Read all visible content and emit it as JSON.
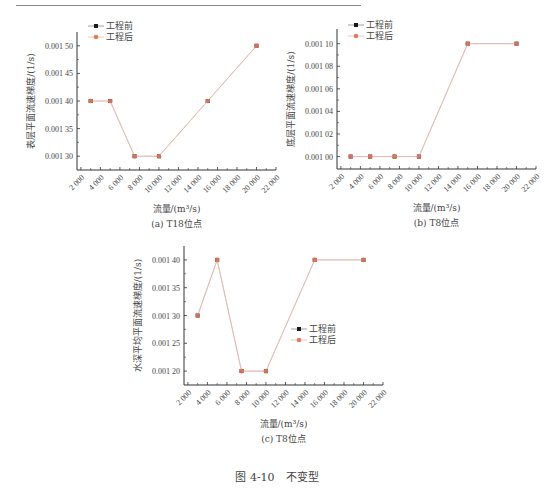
{
  "figure_caption": "图 4-10　不变型",
  "colors": {
    "before": "#1a1a1a",
    "after": "#e07a5f",
    "line": "#f0b8a8",
    "axis": "#333333"
  },
  "chart_data": [
    {
      "id": "a",
      "type": "line",
      "caption": "(a) T18位点",
      "xlabel": "流量/(m³/s)",
      "ylabel": "表层平面流速梯度/(1/s)",
      "xlim": [
        2000,
        22000
      ],
      "xticks": [
        2000,
        4000,
        6000,
        8000,
        10000,
        12000,
        14000,
        16000,
        18000,
        20000,
        22000
      ],
      "xtick_labels": [
        "2 000",
        "4 000",
        "6 000",
        "8 000",
        "10 000",
        "12 000",
        "14 000",
        "16 000",
        "18 000",
        "20 000",
        "22 000"
      ],
      "ylim": [
        0.001275,
        0.001525
      ],
      "yticks": [
        0.0013,
        0.00135,
        0.0014,
        0.00145,
        0.0015
      ],
      "ytick_labels": [
        "0.001 30",
        "0.001 35",
        "0.001 40",
        "0.001 45",
        "0.001 50"
      ],
      "legend": {
        "position": "top-left",
        "entries": [
          "工程前",
          "工程后"
        ]
      },
      "x": [
        3000,
        5000,
        7500,
        10000,
        15000,
        20000
      ],
      "series": [
        {
          "name": "工程前",
          "values": [
            0.0014,
            0.0014,
            0.0013,
            0.0013,
            0.0014,
            0.0015
          ]
        },
        {
          "name": "工程后",
          "values": [
            0.0014,
            0.0014,
            0.0013,
            0.0013,
            0.0014,
            0.0015
          ]
        }
      ]
    },
    {
      "id": "b",
      "type": "line",
      "caption": "(b) T8位点",
      "xlabel": "流量/(m³/s)",
      "ylabel": "底层平面流速梯度/(1/s)",
      "xlim": [
        2000,
        22000
      ],
      "xticks": [
        2000,
        4000,
        6000,
        8000,
        10000,
        12000,
        14000,
        16000,
        18000,
        20000,
        22000
      ],
      "xtick_labels": [
        "2 000",
        "4 000",
        "6 000",
        "8 000",
        "10 000",
        "12 000",
        "14 000",
        "16 000",
        "18 000",
        "20 000",
        "22 000"
      ],
      "ylim": [
        0.000989,
        0.001113
      ],
      "yticks": [
        0.001,
        0.00102,
        0.00104,
        0.00106,
        0.00108,
        0.0011
      ],
      "ytick_labels": [
        "0.001 00",
        "0.001 02",
        "0.001 04",
        "0.001 06",
        "0.001 08",
        "0.001 10"
      ],
      "legend": {
        "position": "top-left",
        "entries": [
          "工程前",
          "工程后"
        ]
      },
      "x": [
        3000,
        5000,
        7500,
        10000,
        15000,
        20000
      ],
      "series": [
        {
          "name": "工程前",
          "values": [
            0.001,
            0.001,
            0.001,
            0.001,
            0.0011,
            0.0011
          ]
        },
        {
          "name": "工程后",
          "values": [
            0.001,
            0.001,
            0.001,
            0.001,
            0.0011,
            0.0011
          ]
        }
      ]
    },
    {
      "id": "c",
      "type": "line",
      "caption": "(c) T8位点",
      "xlabel": "流量/(m³/s)",
      "ylabel": "水深平均平面流速梯度/(1/s)",
      "xlim": [
        2000,
        22000
      ],
      "xticks": [
        2000,
        4000,
        6000,
        8000,
        10000,
        12000,
        14000,
        16000,
        18000,
        20000,
        22000
      ],
      "xtick_labels": [
        "2 000",
        "4 000",
        "6 000",
        "8 000",
        "10 000",
        "12 000",
        "14 000",
        "16 000",
        "18 000",
        "20 000",
        "22 000"
      ],
      "ylim": [
        0.001175,
        0.001425
      ],
      "yticks": [
        0.0012,
        0.00125,
        0.0013,
        0.00135,
        0.0014
      ],
      "ytick_labels": [
        "0.001 20",
        "0.001 25",
        "0.001 30",
        "0.001 35",
        "0.001 40"
      ],
      "legend": {
        "position": "right",
        "entries": [
          "工程前",
          "工程后"
        ]
      },
      "x": [
        3000,
        5000,
        7500,
        10000,
        15000,
        20000
      ],
      "series": [
        {
          "name": "工程前",
          "values": [
            0.0013,
            0.0014,
            0.0012,
            0.0012,
            0.0014,
            0.0014
          ]
        },
        {
          "name": "工程后",
          "values": [
            0.0013,
            0.0014,
            0.0012,
            0.0012,
            0.0014,
            0.0014
          ]
        }
      ]
    }
  ]
}
